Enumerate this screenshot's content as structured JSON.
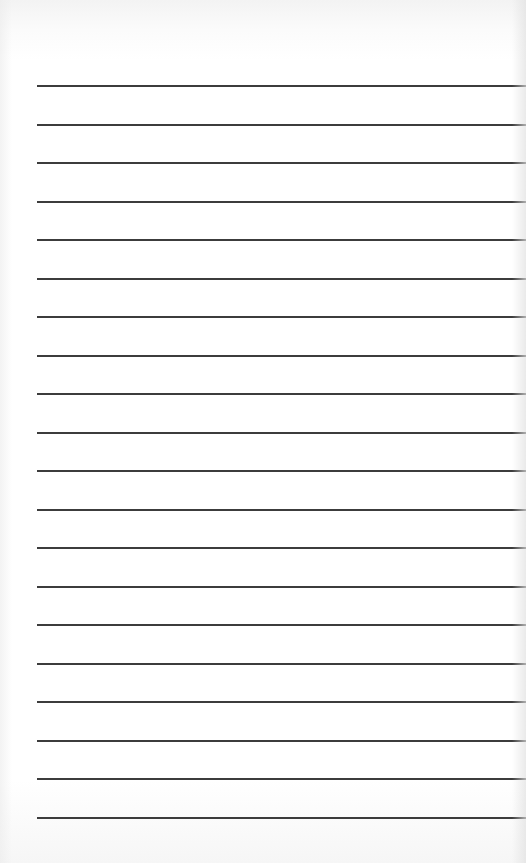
{
  "page": {
    "type": "lined-paper",
    "line_count": 20,
    "line_color": "#3c3c3c",
    "background_color": "#ffffff",
    "lines": [
      {
        "y": 85
      },
      {
        "y": 124
      },
      {
        "y": 162
      },
      {
        "y": 201
      },
      {
        "y": 239
      },
      {
        "y": 278
      },
      {
        "y": 316
      },
      {
        "y": 355
      },
      {
        "y": 393
      },
      {
        "y": 432
      },
      {
        "y": 470
      },
      {
        "y": 509
      },
      {
        "y": 547
      },
      {
        "y": 586
      },
      {
        "y": 624
      },
      {
        "y": 663
      },
      {
        "y": 701
      },
      {
        "y": 740
      },
      {
        "y": 778
      },
      {
        "y": 817
      }
    ],
    "text": ""
  }
}
